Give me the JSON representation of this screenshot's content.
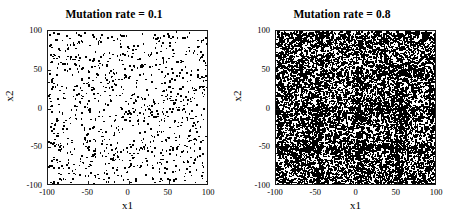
{
  "figure": {
    "background": "#ffffff",
    "marker_color": "#000000",
    "axis_color": "#1a1a1a"
  },
  "chart_data": [
    {
      "type": "scatter",
      "title": "Mutation rate = 0.1",
      "xlabel": "x1",
      "ylabel": "x2",
      "xlim": [
        -100,
        100
      ],
      "ylim": [
        -100,
        100
      ],
      "xticks": [
        -100,
        -50,
        0,
        50,
        100
      ],
      "yticks": [
        -100,
        -50,
        0,
        50,
        100
      ],
      "xticklabels": [
        "-100",
        "-50",
        "0",
        "50",
        "100"
      ],
      "yticklabels": [
        "-100",
        "-50",
        "0",
        "50",
        "100"
      ],
      "grid": false,
      "legend": false,
      "marker": "square",
      "marker_size": 1.6,
      "marker_color": "#000000",
      "n_points": 1000,
      "distribution": "uniform",
      "seed": 101
    },
    {
      "type": "scatter",
      "title": "Mutation rate = 0.8",
      "xlabel": "x1",
      "ylabel": "x2",
      "xlim": [
        -100,
        100
      ],
      "ylim": [
        -100,
        100
      ],
      "xticks": [
        -100,
        -50,
        0,
        50,
        100
      ],
      "yticks": [
        -100,
        -50,
        0,
        50,
        100
      ],
      "xticklabels": [
        "-100",
        "-50",
        "0",
        "50",
        "100"
      ],
      "yticklabels": [
        "-100",
        "-50",
        "0",
        "50",
        "100"
      ],
      "grid": false,
      "legend": false,
      "marker": "square",
      "marker_size": 1.6,
      "marker_color": "#000000",
      "n_points": 11000,
      "distribution": "uniform",
      "seed": 808
    }
  ]
}
